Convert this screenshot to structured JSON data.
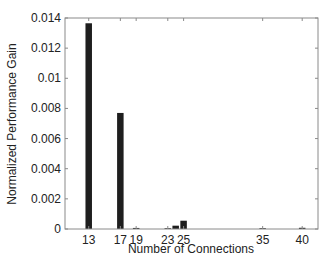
{
  "chart_data": {
    "type": "bar",
    "title": "",
    "xlabel": "Number of Connections",
    "ylabel": "Normalized Performance Gain",
    "xlim": [
      10,
      42
    ],
    "ylim": [
      0,
      0.014
    ],
    "grid": false,
    "legend": null,
    "x_ticks": [
      13,
      17,
      19,
      23,
      25,
      35,
      40
    ],
    "y_ticks": [
      0,
      0.002,
      0.004,
      0.006,
      0.008,
      0.01,
      0.012,
      0.014
    ],
    "y_tick_labels": [
      "0",
      "0.002",
      "0.004",
      "0.006",
      "0.008",
      "0.01",
      "0.012",
      "0.014"
    ],
    "bar_color": "#1e1e1e",
    "x": [
      13,
      17,
      19,
      23,
      24,
      25,
      35,
      40
    ],
    "values": [
      0.01365,
      0.0077,
      7e-05,
      2e-05,
      0.00022,
      0.00055,
      2e-05,
      8e-05
    ]
  }
}
